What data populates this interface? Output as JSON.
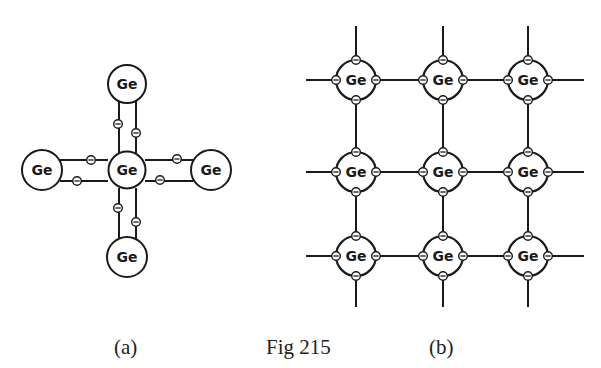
{
  "figure": {
    "caption": "Fig 215",
    "label_a": "(a)",
    "label_b": "(b)"
  },
  "atom_label": "Ge",
  "colors": {
    "ink": "#1a1a1a",
    "background": "#ffffff"
  },
  "diagram_a": {
    "description": "Single germanium atom covalently bonded to four neighbours, each bond with two shared electrons",
    "center": {
      "label": "Ge"
    },
    "neighbours": [
      {
        "label": "Ge",
        "position": "top"
      },
      {
        "label": "Ge",
        "position": "left"
      },
      {
        "label": "Ge",
        "position": "right"
      },
      {
        "label": "Ge",
        "position": "bottom"
      }
    ],
    "electron_symbol": "⊖"
  },
  "diagram_b": {
    "description": "3x3 lattice of germanium atoms, each with four electrons on its circle, joined by bonds",
    "rows": 3,
    "cols": 3,
    "atoms": [
      [
        "Ge",
        "Ge",
        "Ge"
      ],
      [
        "Ge",
        "Ge",
        "Ge"
      ],
      [
        "Ge",
        "Ge",
        "Ge"
      ]
    ],
    "electron_symbol": "⊖"
  }
}
